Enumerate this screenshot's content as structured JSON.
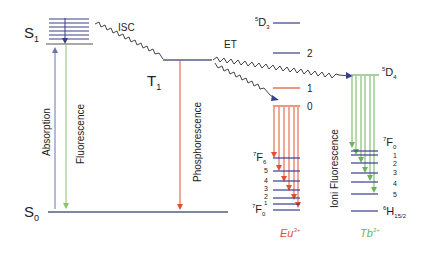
{
  "diagram": {
    "type": "Jablonski energy-transfer diagram",
    "colors": {
      "level": "#3a3f8a",
      "absorption": "#6c72b0",
      "fluorescence": "#8cc46a",
      "phosphorescence": "#e0522f",
      "eu": "#e0522f",
      "tb": "#6fb15a",
      "wavy": "#444444",
      "text": "#222222"
    },
    "states": {
      "s1": {
        "main": "S",
        "sub": "1"
      },
      "s0": {
        "main": "S",
        "sub": "0"
      },
      "t1": {
        "main": "T",
        "sub": "1"
      }
    },
    "transitions": {
      "isc": "ISC",
      "et": "ET",
      "absorption": "Absorption",
      "fluorescence": "Fluorescence",
      "phosphorescence": "Phosphorescence",
      "ion_fluorescence": "Ioni Fluorescence"
    },
    "eu": {
      "ion": "Eu",
      "charge": "3+",
      "upper_label": {
        "sup": "5",
        "main": "D",
        "sub": "3"
      },
      "upper_levels": [
        "2",
        "1",
        "0"
      ],
      "lower_top": {
        "sup": "7",
        "main": "F",
        "sub": "6"
      },
      "lower_levels": [
        "5",
        "4",
        "3",
        "2",
        "1"
      ],
      "lower_bottom": {
        "sup": "7",
        "main": "F",
        "sub": "0"
      }
    },
    "tb": {
      "ion": "Tb",
      "charge": "3+",
      "upper_label": {
        "sup": "5",
        "main": "D",
        "sub": "4"
      },
      "lower_top": {
        "sup": "7",
        "main": "F",
        "sub": "0"
      },
      "lower_levels": [
        "1",
        "2",
        "3",
        "4",
        "5"
      ],
      "ground": {
        "sup": "6",
        "main": "H",
        "sub": "15/2"
      }
    }
  }
}
